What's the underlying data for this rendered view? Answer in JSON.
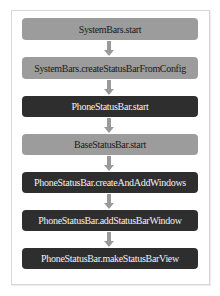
{
  "diagram": {
    "type": "flowchart",
    "direction": "top-to-bottom",
    "colors": {
      "light_box": "#9c9c9c",
      "dark_box": "#2e2e2e",
      "arrow": "#9a9a9a"
    },
    "steps": [
      {
        "label": "SystemBars.start",
        "style": "light"
      },
      {
        "label": "SystemBars.createStatusBarFromConfig",
        "style": "light"
      },
      {
        "label": "PhoneStatusBar.start",
        "style": "dark"
      },
      {
        "label": "BaseStatusBar.start",
        "style": "light"
      },
      {
        "label": "PhoneStatusBar.createAndAddWindows",
        "style": "dark"
      },
      {
        "label": "PhoneStatusBar.addStatusBarWindow",
        "style": "dark"
      },
      {
        "label": "PhoneStatusBar.makeStatusBarView",
        "style": "dark"
      }
    ]
  }
}
